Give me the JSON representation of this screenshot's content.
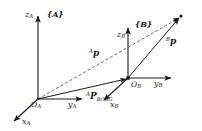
{
  "figure": {
    "stroke_color": "#1a1a1a",
    "background_color": "#ffffff"
  },
  "frames": [
    {
      "id": "A",
      "label": "{A}",
      "origin_label": "O",
      "origin_subscript": "A",
      "axes": [
        {
          "name": "z",
          "subscript": "A",
          "label": "z"
        },
        {
          "name": "y",
          "subscript": "A",
          "label": "y"
        },
        {
          "name": "x",
          "subscript": "A",
          "label": "x"
        }
      ]
    },
    {
      "id": "B",
      "label": "{B}",
      "origin_label": "O",
      "origin_subscript": "B",
      "axes": [
        {
          "name": "z",
          "subscript": "B",
          "label": "z"
        },
        {
          "name": "y",
          "subscript": "B",
          "label": "y"
        },
        {
          "name": "x",
          "subscript": "B",
          "label": "x"
        }
      ]
    }
  ],
  "vectors": [
    {
      "id": "a-p",
      "presuperscript": "A",
      "symbol": "p",
      "subscript": "",
      "style": "dashed",
      "from": "O_A",
      "to": "P"
    },
    {
      "id": "b-p",
      "presuperscript": "B",
      "symbol": "p",
      "subscript": "",
      "style": "solid",
      "from": "O_B",
      "to": "P"
    },
    {
      "id": "a-p-borg",
      "presuperscript": "A",
      "symbol": "P",
      "subscript": "BORG",
      "style": "solid",
      "from": "O_A",
      "to": "O_B"
    }
  ]
}
